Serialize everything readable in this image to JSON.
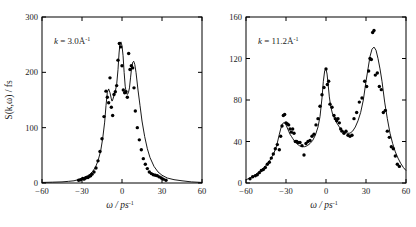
{
  "figure": {
    "background_color": "#ffffff",
    "ink_color": "#000000",
    "panel_count": 2
  },
  "chart_data": [
    {
      "type": "scatter",
      "panel": "left",
      "title": "",
      "annotation": "k = 3.0Å",
      "annotation_sup": "-1",
      "annotation_symbol": "k",
      "xlabel": "ω / ps",
      "xlabel_sup": "-1",
      "ylabel": "S(k,ω) / fs",
      "xlim": [
        -60,
        60
      ],
      "ylim": [
        0,
        300
      ],
      "xticks": [
        -60,
        -30,
        0,
        30,
        60
      ],
      "xticklabels": [
        "−60",
        "−30",
        "0",
        "30",
        "60"
      ],
      "yticks": [
        0,
        100,
        200,
        300
      ],
      "yticklabels": [
        "0",
        "100",
        "200",
        "300"
      ],
      "grid": false,
      "legend": false,
      "marker": "filled-circle",
      "series": [
        {
          "name": "experimental-points",
          "kind": "scatter",
          "x": [
            -32.5,
            -31.0,
            -29.5,
            -28.5,
            -27.5,
            -26.5,
            -25.5,
            -24.5,
            -23.5,
            -22.5,
            -21.0,
            -19.5,
            -18.0,
            -16.5,
            -15.0,
            -13.5,
            -12.0,
            -11.0,
            -10.0,
            -9.0,
            -8.0,
            -7.0,
            -6.0,
            -5.0,
            -4.0,
            -3.0,
            -2.0,
            -1.0,
            0.0,
            1.0,
            2.0,
            3.0,
            4.0,
            5.0,
            6.0,
            7.0,
            8.0,
            9.0,
            10.0,
            11.5,
            13.0,
            14.5,
            16.0,
            17.5,
            19.0,
            20.5,
            22.0,
            23.5,
            25.0,
            26.5,
            28.0,
            29.5,
            31.0,
            33.0
          ],
          "y": [
            5,
            6,
            8,
            7,
            9,
            10,
            10,
            12,
            13,
            16,
            20,
            27,
            40,
            57,
            80,
            120,
            166,
            155,
            145,
            190,
            137,
            122,
            160,
            165,
            176,
            222,
            252,
            246,
            212,
            168,
            163,
            165,
            155,
            234,
            205,
            212,
            208,
            172,
            130,
            100,
            78,
            60,
            44,
            34,
            26,
            20,
            17,
            15,
            14,
            13,
            11,
            9,
            7,
            5
          ]
        },
        {
          "name": "model-fit-curve",
          "kind": "line",
          "x": [
            -60,
            -52,
            -45,
            -40,
            -36,
            -33,
            -30,
            -28,
            -26,
            -24,
            -22,
            -20,
            -18,
            -16,
            -14.5,
            -13,
            -12,
            -11,
            -10,
            -9,
            -8,
            -7.5,
            -7,
            -6,
            -5,
            -4,
            -3,
            -2.2,
            -1.5,
            -0.8,
            0,
            0.8,
            1.6,
            2.4,
            3.2,
            4,
            4.8,
            5.6,
            6.4,
            7.2,
            8,
            8.8,
            9.6,
            10.5,
            12,
            13.5,
            15,
            17,
            19,
            21,
            24,
            27,
            30,
            34,
            39,
            45,
            52,
            60
          ],
          "y": [
            1,
            1.5,
            2,
            3,
            4,
            6,
            8,
            10,
            13,
            16,
            21,
            28,
            40,
            58,
            80,
            110,
            140,
            164,
            170,
            163,
            152,
            148,
            150,
            158,
            166,
            178,
            205,
            235,
            252,
            255,
            248,
            230,
            200,
            175,
            163,
            160,
            163,
            172,
            190,
            208,
            218,
            220,
            214,
            200,
            168,
            140,
            112,
            84,
            62,
            46,
            30,
            20,
            14,
            9,
            6,
            4,
            2,
            1
          ]
        }
      ]
    },
    {
      "type": "scatter",
      "panel": "right",
      "title": "",
      "annotation": "k = 11.2Å",
      "annotation_sup": "-1",
      "annotation_symbol": "k",
      "xlabel": "ω / ps",
      "xlabel_sup": "-1",
      "ylabel": "",
      "xlim": [
        -60,
        60
      ],
      "ylim": [
        0,
        160
      ],
      "xticks": [
        -60,
        -30,
        0,
        30,
        60
      ],
      "xticklabels": [
        "−60",
        "−30",
        "0",
        "30",
        "60"
      ],
      "yticks": [
        0,
        40,
        80,
        120,
        160
      ],
      "yticklabels": [
        "0",
        "40",
        "80",
        "120",
        "160"
      ],
      "grid": false,
      "legend": false,
      "marker": "filled-circle",
      "series": [
        {
          "name": "experimental-points",
          "kind": "scatter",
          "x": [
            -57.0,
            -55.0,
            -53.0,
            -51.5,
            -50.0,
            -48.5,
            -47.0,
            -45.5,
            -44.0,
            -42.5,
            -41.0,
            -39.5,
            -38.0,
            -36.5,
            -35.0,
            -34.0,
            -33.0,
            -32.0,
            -31.0,
            -30.0,
            -29.0,
            -28.0,
            -27.0,
            -26.0,
            -25.0,
            -24.0,
            -23.0,
            -22.0,
            -21.0,
            -19.5,
            -18.0,
            -16.5,
            -15.0,
            -13.5,
            -12.0,
            -10.5,
            -9.0,
            -7.5,
            -6.0,
            -4.5,
            -3.0,
            -1.5,
            0.0,
            1.0,
            2.0,
            3.0,
            4.5,
            6.0,
            7.0,
            8.0,
            9.0,
            10.0,
            11.0,
            12.0,
            13.5,
            15.0,
            16.5,
            18.0,
            19.5,
            21.0,
            23.0,
            25.0,
            27.0,
            29.0,
            30.5,
            32.0,
            33.0,
            34.0,
            35.0,
            36.0,
            37.0,
            38.5,
            40.0,
            41.5,
            43.0,
            44.5,
            46.0,
            47.5,
            49.0,
            50.5,
            52.0,
            53.5,
            55.0
          ],
          "y": [
            4,
            6,
            7,
            8,
            10,
            12,
            13,
            15,
            18,
            20,
            24,
            28,
            33,
            37,
            32,
            45,
            55,
            65,
            66,
            58,
            57,
            56,
            52,
            49,
            52,
            48,
            40,
            40,
            39,
            39,
            36,
            27,
            38,
            40,
            41,
            45,
            47,
            56,
            62,
            74,
            85,
            92,
            110,
            95,
            98,
            76,
            73,
            65,
            62,
            60,
            62,
            58,
            52,
            50,
            48,
            50,
            46,
            45,
            46,
            62,
            68,
            78,
            82,
            98,
            93,
            108,
            120,
            119,
            145,
            147,
            104,
            106,
            93,
            90,
            68,
            70,
            50,
            44,
            35,
            33,
            26,
            18,
            16
          ]
        },
        {
          "name": "model-fit-curve",
          "kind": "line",
          "x": [
            -60,
            -57,
            -54,
            -51,
            -48,
            -45,
            -42,
            -39,
            -37,
            -35,
            -34,
            -33,
            -32,
            -31,
            -30,
            -29,
            -28,
            -27,
            -26,
            -25,
            -24,
            -22,
            -20,
            -18,
            -16,
            -14,
            -12,
            -10,
            -8,
            -6,
            -4.5,
            -3,
            -2,
            -1,
            0,
            0.8,
            1.6,
            2.5,
            3.5,
            5,
            6.5,
            8,
            10,
            12,
            14,
            16,
            18,
            20,
            22,
            24,
            26,
            28,
            30,
            31.5,
            33,
            34.5,
            36,
            37.5,
            39,
            40.5,
            42,
            44,
            46,
            48,
            50,
            52,
            54,
            56,
            58,
            60
          ],
          "y": [
            3,
            5,
            7,
            10,
            13,
            17,
            22,
            29,
            36,
            47,
            52,
            56,
            58,
            58,
            56,
            53,
            50,
            47,
            45,
            43,
            41,
            38,
            36,
            35,
            35,
            36,
            38,
            41,
            46,
            54,
            64,
            82,
            98,
            108,
            110,
            105,
            95,
            83,
            74,
            66,
            62,
            58,
            54,
            51,
            49,
            48,
            48,
            50,
            54,
            60,
            68,
            80,
            98,
            110,
            122,
            129,
            131,
            128,
            120,
            110,
            98,
            78,
            62,
            48,
            38,
            30,
            24,
            19,
            15,
            12
          ]
        }
      ]
    }
  ]
}
